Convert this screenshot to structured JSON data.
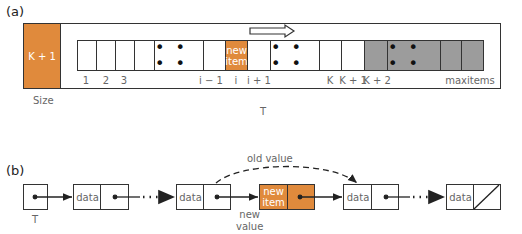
{
  "part_a": {
    "label": "(a)",
    "size_box": {
      "value": "K + 1",
      "caption": "Size"
    },
    "array_caption": "T",
    "cells": [
      {
        "index_label": "1",
        "content": "",
        "state": "used"
      },
      {
        "index_label": "2",
        "content": "",
        "state": "used"
      },
      {
        "index_label": "3",
        "content": "",
        "state": "used"
      },
      {
        "index_label": "",
        "content": "",
        "state": "used"
      },
      {
        "index_label": "",
        "content": "• • • •",
        "state": "used-ellipsis"
      },
      {
        "index_label": "i − 1",
        "content": "",
        "state": "used"
      },
      {
        "index_label": "i",
        "content": "new item",
        "state": "inserted"
      },
      {
        "index_label": "i + 1",
        "content": "",
        "state": "used"
      },
      {
        "index_label": "",
        "content": "• • • •",
        "state": "used-ellipsis"
      },
      {
        "index_label": "K",
        "content": "",
        "state": "used"
      },
      {
        "index_label": "K + 1",
        "content": "",
        "state": "used"
      },
      {
        "index_label": "K + 2",
        "content": "",
        "state": "free"
      },
      {
        "index_label": "",
        "content": "• • • •",
        "state": "free-ellipsis"
      },
      {
        "index_label": "",
        "content": "",
        "state": "free"
      },
      {
        "index_label": "maxitems",
        "content": "",
        "state": "free"
      }
    ],
    "new_item_line1": "new",
    "new_item_line2": "item",
    "shift_arrow": "shift-right-arrow",
    "ellipsis": "• • • •"
  },
  "part_b": {
    "label": "(b)",
    "head_caption": "T",
    "node_data_label": "data",
    "new_item_line1": "new",
    "new_item_line2": "item",
    "new_value_line1": "new",
    "new_value_line2": "value",
    "old_value_label": "old value",
    "ellipsis": "• • •"
  },
  "colors": {
    "inserted": "#e08a3c",
    "free": "#9c9c9c",
    "border": "#333333"
  }
}
